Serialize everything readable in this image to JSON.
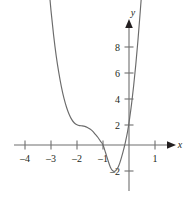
{
  "chart_data": {
    "type": "line",
    "title": "",
    "xlabel": "x",
    "ylabel": "y",
    "xlim": [
      -4.9,
      2.1
    ],
    "ylim": [
      -2.9,
      8.9
    ],
    "grid": false,
    "legend": null,
    "axis_labels": {
      "x": "x",
      "y": "y"
    },
    "x_ticks": [
      {
        "value": -4,
        "label": "–4"
      },
      {
        "value": -3,
        "label": "–3"
      },
      {
        "value": -2,
        "label": "–2"
      },
      {
        "value": -1,
        "label": "–1"
      },
      {
        "value": 1,
        "label": "1"
      }
    ],
    "y_ticks": [
      {
        "value": 8,
        "label": "8"
      },
      {
        "value": 6,
        "label": "6"
      },
      {
        "value": 4,
        "label": "4"
      },
      {
        "value": 2,
        "label": "2"
      },
      {
        "value": -2,
        "label": "–2"
      }
    ],
    "series": [
      {
        "name": "curve",
        "color": "#6b6b6b",
        "points": [
          [
            -3.27,
            8.6
          ],
          [
            -3.2,
            7.6
          ],
          [
            -3.1,
            6.3
          ],
          [
            -3.0,
            5.2
          ],
          [
            -2.9,
            4.25
          ],
          [
            -2.8,
            3.45
          ],
          [
            -2.7,
            2.8
          ],
          [
            -2.6,
            2.25
          ],
          [
            -2.5,
            1.8
          ],
          [
            -2.4,
            1.45
          ],
          [
            -2.3,
            1.18
          ],
          [
            -2.2,
            0.98
          ],
          [
            -2.1,
            0.85
          ],
          [
            -2.0,
            0.78
          ],
          [
            -1.9,
            0.75
          ],
          [
            -1.8,
            0.74
          ],
          [
            -1.7,
            0.72
          ],
          [
            -1.6,
            0.68
          ],
          [
            -1.5,
            0.62
          ],
          [
            -1.4,
            0.54
          ],
          [
            -1.3,
            0.42
          ],
          [
            -1.2,
            0.3
          ],
          [
            -1.1,
            0.15
          ],
          [
            -1.0,
            0.0
          ],
          [
            -0.9,
            -0.3
          ],
          [
            -0.8,
            -0.62
          ],
          [
            -0.72,
            -0.85
          ],
          [
            -0.65,
            -0.97
          ],
          [
            -0.58,
            -1.02
          ],
          [
            -0.5,
            -0.98
          ],
          [
            -0.42,
            -0.86
          ],
          [
            -0.35,
            -0.68
          ],
          [
            -0.28,
            -0.45
          ],
          [
            -0.2,
            -0.15
          ],
          [
            -0.14,
            0.1
          ],
          [
            -0.05,
            0.55
          ],
          [
            0.02,
            1.0
          ],
          [
            0.1,
            1.6
          ],
          [
            0.18,
            2.3
          ],
          [
            0.26,
            3.1
          ],
          [
            0.34,
            4.0
          ],
          [
            0.42,
            5.0
          ],
          [
            0.5,
            6.05
          ],
          [
            0.58,
            7.15
          ],
          [
            0.66,
            8.3
          ],
          [
            0.72,
            9.2
          ]
        ]
      }
    ],
    "annotations": [
      {
        "name": "x-axis-arrow",
        "at": [
          2.05,
          0
        ]
      },
      {
        "name": "y-axis-arrow",
        "at": [
          0,
          8.55
        ]
      }
    ],
    "colors": {
      "curve": "#6b6b6b",
      "axis": "#6f6f6f",
      "text": "#231f20"
    }
  }
}
